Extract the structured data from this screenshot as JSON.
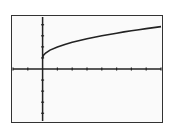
{
  "chart_data": {
    "type": "line",
    "title": "",
    "xlabel": "",
    "ylabel": "",
    "xlim": [
      -2,
      8
    ],
    "ylim": [
      -4.7,
      4.7
    ],
    "x_tick_step": 1,
    "y_tick_step": 1,
    "grid": false,
    "function_label": "y = sqrt(x) + 1",
    "series": [
      {
        "name": "curve",
        "x": [
          0,
          0.05,
          0.2,
          0.5,
          1,
          1.5,
          2,
          2.5,
          3,
          3.5,
          4,
          4.5,
          5,
          5.5,
          6,
          6.5,
          7,
          7.5,
          8
        ],
        "y": [
          1,
          1.22,
          1.45,
          1.71,
          2,
          2.22,
          2.41,
          2.58,
          2.73,
          2.87,
          3,
          3.12,
          3.24,
          3.35,
          3.45,
          3.55,
          3.65,
          3.74,
          3.83
        ]
      }
    ],
    "colors": {
      "axis": "#222222",
      "curve": "#222222",
      "frame": "#333333",
      "background": "#fafafa"
    }
  }
}
